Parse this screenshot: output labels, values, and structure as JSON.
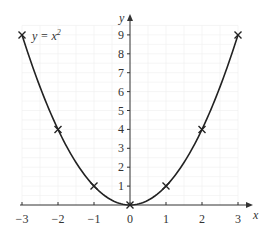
{
  "chart_data": {
    "type": "line",
    "title": "",
    "annotation": "y = x²",
    "xlabel": "x",
    "ylabel": "y",
    "xlim": [
      -3,
      3
    ],
    "ylim": [
      0,
      9
    ],
    "grid": true,
    "x_ticks": [
      "−3",
      "−2",
      "−1",
      "0",
      "1",
      "2",
      "3"
    ],
    "y_ticks": [
      "1",
      "2",
      "3",
      "4",
      "5",
      "6",
      "7",
      "8",
      "9"
    ],
    "series": [
      {
        "name": "y = x²",
        "x": [
          -3,
          -2,
          -1,
          0,
          1,
          2,
          3
        ],
        "values": [
          9,
          4,
          1,
          0,
          1,
          4,
          9
        ],
        "marker": "x"
      }
    ],
    "colors": {
      "curve": "#222222",
      "axis": "#333333",
      "grid": "#eeeeee"
    }
  },
  "labels": {
    "equation_y": "y = x",
    "equation_exp": "2",
    "x_axis": "x",
    "y_axis": "y"
  }
}
